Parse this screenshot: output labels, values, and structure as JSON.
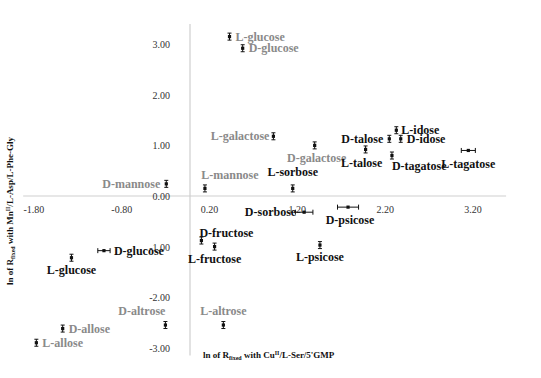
{
  "chart_data": {
    "type": "scatter",
    "title": "",
    "xlabel": "ln of R_fixed with Cu(II)/L-Ser/5'GMP",
    "ylabel": "ln of R_fixed with Mn(II)/L-Asp/L-Phe-Gly",
    "xlabel_parts": {
      "pre": "ln of R",
      "sub": "fixed",
      "mid": " with Cu",
      "sup": "II",
      "post": "/L-Ser/5'GMP"
    },
    "ylabel_parts": {
      "pre": "ln of R",
      "sub": "fixed",
      "mid": " with Mn",
      "sup": "II",
      "post": "/L-Asp/L-Phe-Gly"
    },
    "xlim": [
      -1.9,
      3.6
    ],
    "ylim": [
      -3.1,
      3.4
    ],
    "x_ticks": [
      -1.8,
      -0.8,
      0.2,
      1.2,
      2.2,
      3.2
    ],
    "x_tick_labels": [
      "-1.80",
      "-0.80",
      "0.20",
      "1.20",
      "2.20",
      "3.20"
    ],
    "y_ticks": [
      -3.0,
      -2.0,
      -1.0,
      0.0,
      1.0,
      2.0,
      3.0
    ],
    "y_tick_labels": [
      "-3.00",
      "-2.00",
      "-1.00",
      "0.00",
      "1.00",
      "2.00",
      "3.00"
    ],
    "grid": false,
    "legend": "none",
    "colors": {
      "dark": "#111111",
      "gray": "#8a8a8a",
      "axis": "#cfcfcf"
    },
    "points": [
      {
        "name": "L-glucose",
        "x": 0.45,
        "y": 3.15,
        "color": "gray",
        "label_dx": 6,
        "label_dy": 4,
        "anchor": "start"
      },
      {
        "name": "D-glucose",
        "x": 0.6,
        "y": 2.92,
        "color": "gray",
        "label_dx": 6,
        "label_dy": 4,
        "anchor": "start"
      },
      {
        "name": "L-galactose",
        "x": 0.95,
        "y": 1.18,
        "color": "gray",
        "label_dx": -4,
        "label_dy": 4,
        "anchor": "end"
      },
      {
        "name": "D-galactose",
        "x": 1.42,
        "y": 1.0,
        "color": "gray",
        "label_dx": 2,
        "label_dy": 17,
        "anchor": "middle"
      },
      {
        "name": "D-mannose",
        "x": -0.27,
        "y": 0.24,
        "color": "gray",
        "label_dx": -6,
        "label_dy": 4,
        "anchor": "end"
      },
      {
        "name": "L-mannose",
        "x": 0.17,
        "y": 0.15,
        "color": "gray",
        "label_dx": 25,
        "label_dy": -9,
        "anchor": "middle"
      },
      {
        "name": "L-sorbose",
        "x": 1.17,
        "y": 0.15,
        "color": "dark",
        "label_dx": 0,
        "label_dy": -12,
        "anchor": "middle"
      },
      {
        "name": "D-sorbose",
        "x": 1.3,
        "y": -0.32,
        "color": "dark",
        "label_dx": -8,
        "label_dy": 4,
        "anchor": "end",
        "xerr": 0.1
      },
      {
        "name": "D-psicose",
        "x": 1.8,
        "y": -0.22,
        "color": "dark",
        "label_dx": 2,
        "label_dy": 17,
        "anchor": "middle",
        "xerr": 0.12
      },
      {
        "name": "D-talose",
        "x": 2.27,
        "y": 1.13,
        "color": "dark",
        "label_dx": -6,
        "label_dy": 4,
        "anchor": "end"
      },
      {
        "name": "L-idose",
        "x": 2.35,
        "y": 1.3,
        "color": "dark",
        "label_dx": 5,
        "label_dy": 4,
        "anchor": "start"
      },
      {
        "name": "D-idose",
        "x": 2.4,
        "y": 1.13,
        "color": "dark",
        "label_dx": 6,
        "label_dy": 4,
        "anchor": "start"
      },
      {
        "name": "L-talose",
        "x": 2.0,
        "y": 0.92,
        "color": "dark",
        "label_dx": -4,
        "label_dy": 18,
        "anchor": "middle"
      },
      {
        "name": "D-tagatose",
        "x": 2.3,
        "y": 0.8,
        "color": "dark",
        "label_dx": 0,
        "label_dy": 14,
        "anchor": "start"
      },
      {
        "name": "L-tagatose",
        "x": 3.17,
        "y": 0.9,
        "color": "dark",
        "label_dx": 0,
        "label_dy": 18,
        "anchor": "middle",
        "xerr": 0.08
      },
      {
        "name": "D-fructose",
        "x": 0.13,
        "y": -0.88,
        "color": "dark",
        "label_dx": -2,
        "label_dy": -4,
        "anchor": "start"
      },
      {
        "name": "L-fructose",
        "x": 0.28,
        "y": -1.0,
        "color": "dark",
        "label_dx": 0,
        "label_dy": 16,
        "anchor": "middle"
      },
      {
        "name": "L-psicose",
        "x": 1.48,
        "y": -0.97,
        "color": "dark",
        "label_dx": 0,
        "label_dy": 16,
        "anchor": "middle"
      },
      {
        "name": "D-glucose",
        "x": -0.98,
        "y": -1.08,
        "color": "dark",
        "label_dx": 10,
        "label_dy": 4,
        "anchor": "start",
        "xerr": 0.07
      },
      {
        "name": "L-glucose",
        "x": -1.35,
        "y": -1.22,
        "color": "dark",
        "label_dx": 0,
        "label_dy": 16,
        "anchor": "middle"
      },
      {
        "name": "D-altrose",
        "x": -0.28,
        "y": -2.55,
        "color": "gray",
        "label_dx": 0,
        "label_dy": -10,
        "anchor": "end"
      },
      {
        "name": "L-altrose",
        "x": 0.38,
        "y": -2.55,
        "color": "gray",
        "label_dx": 0,
        "label_dy": -10,
        "anchor": "middle"
      },
      {
        "name": "D-allose",
        "x": -1.45,
        "y": -2.62,
        "color": "gray",
        "label_dx": 6,
        "label_dy": 4,
        "anchor": "start"
      },
      {
        "name": "L-allose",
        "x": -1.75,
        "y": -2.9,
        "color": "gray",
        "label_dx": 6,
        "label_dy": 4,
        "anchor": "start"
      }
    ]
  }
}
